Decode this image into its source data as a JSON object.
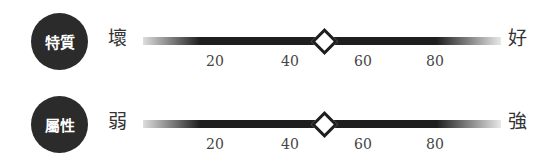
{
  "scales": [
    {
      "badge": "特質",
      "left_label": "壞",
      "right_label": "好",
      "value": 50,
      "ticks": [
        "20",
        "40",
        "60",
        "80"
      ]
    },
    {
      "badge": "屬性",
      "left_label": "弱",
      "right_label": "強",
      "value": 50,
      "ticks": [
        "20",
        "40",
        "60",
        "80"
      ]
    }
  ],
  "colors": {
    "badge_bg": "#2b2b2b",
    "bar": "#1e1e1e",
    "marker_fill": "#ffffff"
  }
}
